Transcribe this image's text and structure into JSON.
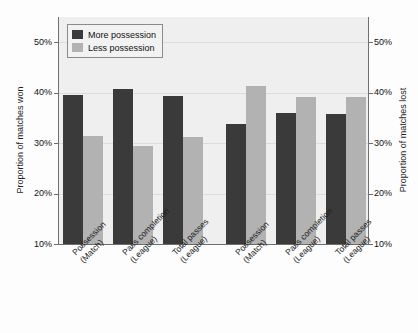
{
  "chart_data": {
    "type": "bar",
    "title": "",
    "xlabel": "",
    "ylabel": "Proportion of matches won",
    "ylabel_right": "Proportion of matches lost",
    "ylim": [
      10,
      55
    ],
    "yticks": [
      "10%",
      "20%",
      "30%",
      "40%",
      "50%"
    ],
    "ytick_values": [
      10,
      20,
      30,
      40,
      50
    ],
    "grid": true,
    "legend_position": "top-left",
    "categories": [
      "Possession (Match)",
      "Pass completion (League)",
      "Total passes (League)",
      "Possession (Match)",
      "Pass completion (League)",
      "Total passes (League)"
    ],
    "category_lines": [
      {
        "line1": "Possession",
        "line2": "(Match)"
      },
      {
        "line1": "Pass completion",
        "line2": "(League)"
      },
      {
        "line1": "Total passes",
        "line2": "(League)"
      },
      {
        "line1": "Possession",
        "line2": "(Match)"
      },
      {
        "line1": "Pass completion",
        "line2": "(League)"
      },
      {
        "line1": "Total passes",
        "line2": "(League)"
      }
    ],
    "panels": [
      {
        "name": "Proportion of matches won",
        "category_indices": [
          0,
          1,
          2
        ]
      },
      {
        "name": "Proportion of matches lost",
        "category_indices": [
          3,
          4,
          5
        ]
      }
    ],
    "series": [
      {
        "name": "More possession",
        "color": "#3a3a3a",
        "values": [
          39.5,
          40.8,
          39.3,
          33.7,
          35.9,
          35.7
        ]
      },
      {
        "name": "Less possession",
        "color": "#b2b2b2",
        "values": [
          31.4,
          29.4,
          31.3,
          41.3,
          39.2,
          39.2
        ]
      }
    ]
  },
  "legend": {
    "items": [
      {
        "label": "More possession",
        "key": "more"
      },
      {
        "label": "Less possession",
        "key": "less"
      }
    ]
  },
  "axes": {
    "left_title": "Proportion of matches won",
    "right_title": "Proportion of matches lost"
  },
  "colors": {
    "more_possession": "#3a3a3a",
    "less_possession": "#b2b2b2",
    "plot_background": "#efefef",
    "gridline": "#dcdcdc",
    "axis": "#6d6d6d"
  }
}
